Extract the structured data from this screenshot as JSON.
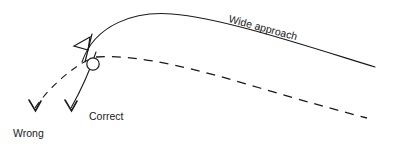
{
  "diagram": {
    "background_color": "#ffffff",
    "ink_color": "#1a1a1a",
    "width": 394,
    "height": 144,
    "labels": {
      "wide_approach": "Wide approach",
      "correct": "Correct",
      "wrong": "Wrong"
    },
    "elements": {
      "flag_name": "flag-marker",
      "ball_name": "ball-circle",
      "solid_curve_name": "wide-approach-solid-curve",
      "dashed_curve_name": "approach-dashed-curve",
      "correct_arrow_name": "correct-direction-arrow",
      "wrong_arrow_name": "wrong-direction-arrow"
    },
    "geometry": {
      "solid_curve_path": "M 82 62 C 95 24 135 11 172 14 C 222 18 300 44 375 67",
      "dashed_curve_path": "M 96 57 C 140 54 200 70 260 88 C 300 100 340 111 367 118",
      "correct_arrow_path": "M 96 52 C 90 70 80 92 71 108",
      "wrong_arrow_path": "M 88 60 C 72 68 50 86 35 108",
      "correct_arrow_head": "M 65 100 L 71.5 111 L 77 101",
      "wrong_arrow_head": "M 29 100 L 35.5 111 L 41 101",
      "flag_pole": "M 92 34 L 85 62",
      "flag_triangle": "M 90 37 L 74 46 L 88 50 Z",
      "ball_cx": 93,
      "ball_cy": 64,
      "ball_r": 6.2,
      "wide_approach_x": 228,
      "wide_approach_y": 22,
      "wide_approach_rotation": 15,
      "correct_label_x": 89,
      "correct_label_y": 120,
      "wrong_label_x": 13,
      "wrong_label_y": 137
    }
  }
}
